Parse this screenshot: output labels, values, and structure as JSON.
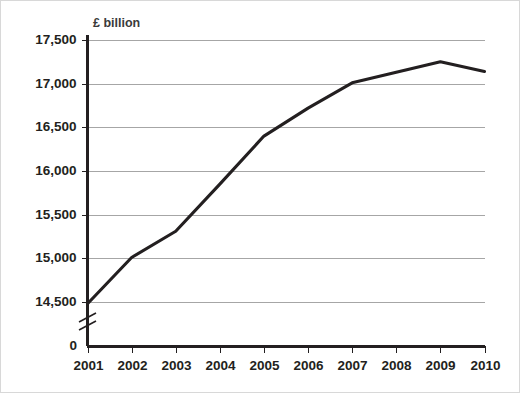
{
  "chart_data": {
    "type": "line",
    "title": "",
    "subtitle": "",
    "xlabel": "",
    "ylabel": "£ billion",
    "unit_label": "£ billion",
    "categories": [
      "2001",
      "2002",
      "2003",
      "2004",
      "2005",
      "2006",
      "2007",
      "2008",
      "2009",
      "2010"
    ],
    "x": [
      2001,
      2002,
      2003,
      2004,
      2005,
      2006,
      2007,
      2008,
      2009,
      2010
    ],
    "values": [
      14480,
      15010,
      15310,
      15850,
      16400,
      16720,
      17010,
      17130,
      17250,
      17140
    ],
    "series": [
      {
        "name": "£ billion",
        "values": [
          14480,
          15010,
          15310,
          15850,
          16400,
          16720,
          17010,
          17130,
          17250,
          17140
        ]
      }
    ],
    "ylim": [
      14500,
      17500
    ],
    "ytick_labels": [
      "17,500",
      "17,000",
      "16,500",
      "16,000",
      "15,500",
      "15,000",
      "14,500"
    ],
    "ytick_values": [
      17500,
      17000,
      16500,
      16000,
      15500,
      15000,
      14500
    ],
    "y_origin_label": "0",
    "axis_break": true,
    "grid": "horizontal",
    "legend": "none",
    "line_color": "#231f20",
    "grid_color": "#a6a6a6",
    "background_color": "#ffffff"
  }
}
